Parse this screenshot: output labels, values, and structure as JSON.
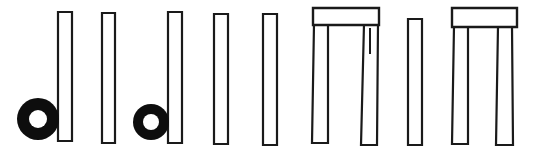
{
  "figure": {
    "background_color": "#ffffff",
    "stroke_color": "#1a1a1a",
    "fill_color": "#ffffff",
    "ring_color": "#0d0d0d",
    "width": 536,
    "height": 155,
    "caption": ""
  },
  "elements": {
    "standing_stones": [
      {
        "name": "standing-stone-1",
        "label": "1",
        "x": 58,
        "y": 12,
        "width": 14,
        "height": 129,
        "top_width": 14,
        "bottom_width": 14
      },
      {
        "name": "standing-stone-2",
        "label": "2",
        "x": 102,
        "y": 13,
        "width": 13,
        "height": 130,
        "top_width": 13,
        "bottom_width": 13
      },
      {
        "name": "standing-stone-3",
        "label": "3",
        "x": 168,
        "y": 12,
        "width": 14,
        "height": 131,
        "top_width": 14,
        "bottom_width": 14
      },
      {
        "name": "standing-stone-4",
        "label": "4",
        "x": 214,
        "y": 14,
        "width": 14,
        "height": 130,
        "top_width": 14,
        "bottom_width": 14
      },
      {
        "name": "standing-stone-5",
        "label": "5",
        "x": 263,
        "y": 14,
        "width": 14,
        "height": 131,
        "top_width": 14,
        "bottom_width": 14
      },
      {
        "name": "standing-stone-6",
        "label": "6",
        "x": 408,
        "y": 19,
        "width": 14,
        "height": 126,
        "top_width": 14,
        "bottom_width": 14
      }
    ],
    "rings": [
      {
        "name": "ring-1",
        "label": "A",
        "cx": 38,
        "cy": 119,
        "outer_radius": 21,
        "inner_radius": 9
      },
      {
        "name": "ring-2",
        "label": "B",
        "cx": 151,
        "cy": 122,
        "outer_radius": 18,
        "inner_radius": 8
      }
    ],
    "trilithons": [
      {
        "name": "trilithon-1",
        "label": "I",
        "lintel": {
          "x": 313,
          "y": 8,
          "width": 66,
          "height": 17
        },
        "left_upright": {
          "top_x": 314,
          "bottom_x": 312,
          "top_width": 14,
          "bottom_width": 16,
          "y": 24,
          "height": 119
        },
        "right_upright": {
          "top_x": 364,
          "bottom_x": 361,
          "top_width": 14,
          "bottom_width": 16,
          "y": 24,
          "height": 121
        },
        "inner_mark": {
          "x": 369,
          "y": 28,
          "width": 2,
          "height": 26
        }
      },
      {
        "name": "trilithon-2",
        "label": "II",
        "lintel": {
          "x": 452,
          "y": 8,
          "width": 65,
          "height": 19
        },
        "left_upright": {
          "top_x": 454,
          "bottom_x": 452,
          "top_width": 14,
          "bottom_width": 16,
          "y": 26,
          "height": 118
        },
        "right_upright": {
          "top_x": 498,
          "bottom_x": 496,
          "top_width": 14,
          "bottom_width": 17,
          "y": 26,
          "height": 119
        },
        "inner_mark": null
      }
    ]
  },
  "counts": {
    "standing_stones": 6,
    "rings": 2,
    "trilithons": 2,
    "total_shapes": 10
  }
}
